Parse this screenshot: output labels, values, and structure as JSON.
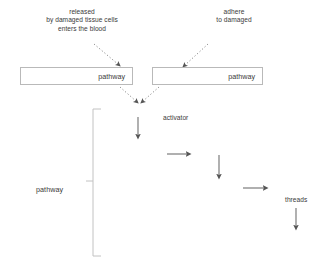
{
  "diagram": {
    "background_color": "#ffffff",
    "text_color": "#3a3a3a",
    "line_color": "#7a7a7a",
    "box_border_color": "#b9b9b9",
    "notes": {
      "left": "released\nby damaged tissue cells\nenters the blood",
      "left_line_1": "released",
      "left_line_2": "by damaged tissue cells",
      "left_line_3": "enters the blood",
      "right_line_1": "adhere",
      "right_line_2": "to damaged"
    },
    "boxes": [
      {
        "id": "intrinsic",
        "label": "pathway"
      },
      {
        "id": "extrinsic",
        "label": "pathway"
      }
    ],
    "labels": {
      "activator": "activator",
      "common_pathway": "pathway",
      "threads": "threads"
    },
    "arrows": [
      {
        "id": "note-left-to-box",
        "style": "dotted",
        "direction": "down-right"
      },
      {
        "id": "note-right-to-box",
        "style": "dotted",
        "direction": "down-left"
      },
      {
        "id": "box-left-to-junction",
        "style": "dotted",
        "direction": "down-right"
      },
      {
        "id": "box-right-to-junction",
        "style": "dotted",
        "direction": "down-left"
      },
      {
        "id": "cascade-step-1",
        "style": "solid",
        "direction": "down"
      },
      {
        "id": "cascade-step-2",
        "style": "solid",
        "direction": "right"
      },
      {
        "id": "cascade-step-3",
        "style": "solid",
        "direction": "down"
      },
      {
        "id": "cascade-step-4",
        "style": "solid",
        "direction": "right"
      },
      {
        "id": "threads-arrow",
        "style": "solid",
        "direction": "down"
      }
    ],
    "bracket": {
      "id": "common-pathway-bracket",
      "orientation": "vertical-left"
    }
  }
}
